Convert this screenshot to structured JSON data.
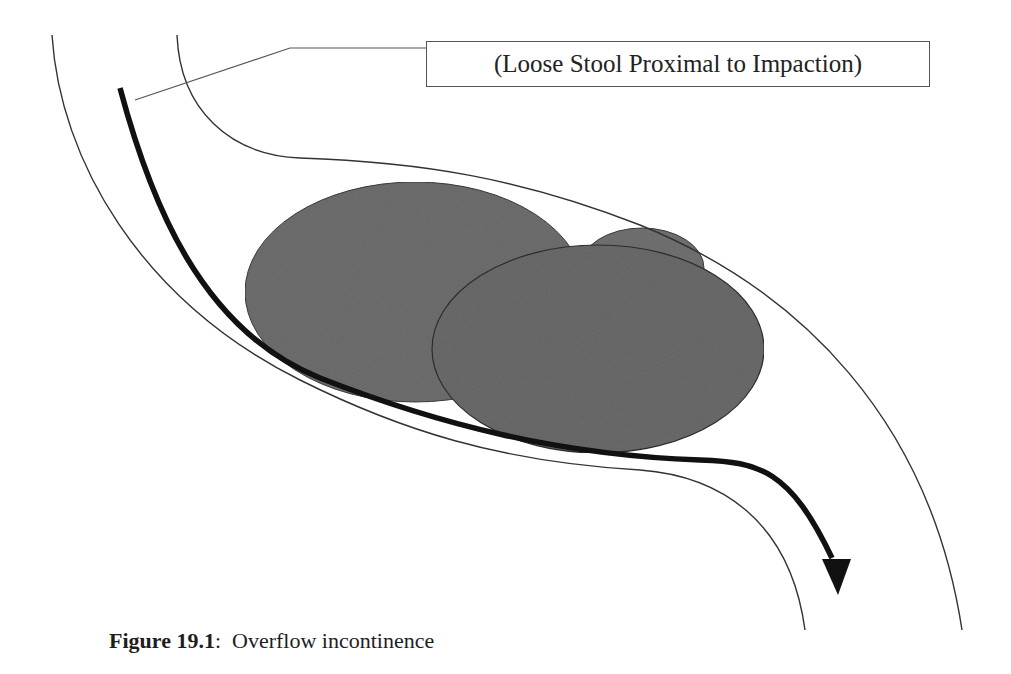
{
  "figure": {
    "label": {
      "text": "(Loose Stool Proximal to Impaction)"
    },
    "caption": {
      "number": "Figure 19.1",
      "separator": ":",
      "text": "Overflow incontinence"
    },
    "elements": [
      {
        "name": "bowel-wall-left",
        "type": "curve"
      },
      {
        "name": "bowel-wall-right",
        "type": "curve"
      },
      {
        "name": "stool-flow-arrow",
        "type": "arrow",
        "description": "loose stool flow bypassing impaction"
      },
      {
        "name": "impaction-mass",
        "type": "ellipse-group",
        "count": 3
      }
    ],
    "colors": {
      "stroke": "#333333",
      "arrow": "#111111",
      "mass_fill": "#6e6e6e",
      "mass_stroke": "#2e2e2e",
      "background": "#ffffff"
    }
  }
}
